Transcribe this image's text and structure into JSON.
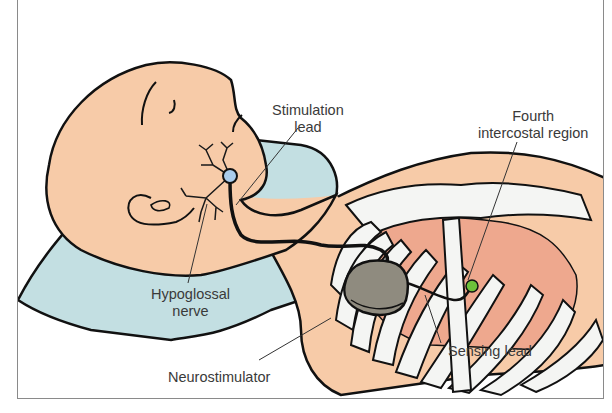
{
  "figure": {
    "labels": {
      "stimulation_lead": [
        "Stimulation",
        "lead"
      ],
      "fourth_intercostal": [
        "Fourth",
        "intercostal region"
      ],
      "hypoglossal_nerve": [
        "Hypoglossal",
        "nerve"
      ],
      "neurostimulator": "Neurostimulator",
      "sensing_lead": "Sensing lead"
    },
    "colors": {
      "skin": "#f7cba8",
      "pillow": "#c3dfe2",
      "lung": "#eea88e",
      "rib": "#f4f5f3",
      "device": "#8f8b7f",
      "stim_electrode": "#a9ccec",
      "sensing_electrode": "#6cc13a",
      "outline": "#111111",
      "frame": "#8a8a8a",
      "label_text": "#3a3a3a"
    }
  }
}
